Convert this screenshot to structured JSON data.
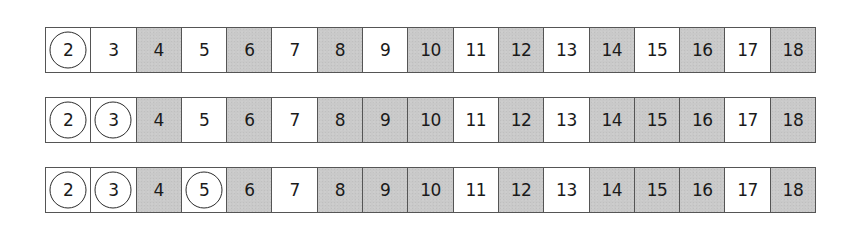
{
  "colors": {
    "shaded": "#c9c9c9",
    "unshaded": "#ffffff",
    "border": "#555555",
    "text": "#1a1a1a",
    "circle": "#2a2a2a"
  },
  "rows": [
    {
      "step": 1,
      "description": "2 circled; multiples of 2 shaded",
      "cells": [
        {
          "n": "2",
          "shaded": false,
          "circled": true
        },
        {
          "n": "3",
          "shaded": false,
          "circled": false
        },
        {
          "n": "4",
          "shaded": true,
          "circled": false
        },
        {
          "n": "5",
          "shaded": false,
          "circled": false
        },
        {
          "n": "6",
          "shaded": true,
          "circled": false
        },
        {
          "n": "7",
          "shaded": false,
          "circled": false
        },
        {
          "n": "8",
          "shaded": true,
          "circled": false
        },
        {
          "n": "9",
          "shaded": false,
          "circled": false
        },
        {
          "n": "10",
          "shaded": true,
          "circled": false
        },
        {
          "n": "11",
          "shaded": false,
          "circled": false
        },
        {
          "n": "12",
          "shaded": true,
          "circled": false
        },
        {
          "n": "13",
          "shaded": false,
          "circled": false
        },
        {
          "n": "14",
          "shaded": true,
          "circled": false
        },
        {
          "n": "15",
          "shaded": false,
          "circled": false
        },
        {
          "n": "16",
          "shaded": true,
          "circled": false
        },
        {
          "n": "17",
          "shaded": false,
          "circled": false
        },
        {
          "n": "18",
          "shaded": true,
          "circled": false
        }
      ]
    },
    {
      "step": 2,
      "description": "2 and 3 circled; multiples of 2 and 3 shaded",
      "cells": [
        {
          "n": "2",
          "shaded": false,
          "circled": true
        },
        {
          "n": "3",
          "shaded": false,
          "circled": true
        },
        {
          "n": "4",
          "shaded": true,
          "circled": false
        },
        {
          "n": "5",
          "shaded": false,
          "circled": false
        },
        {
          "n": "6",
          "shaded": true,
          "circled": false
        },
        {
          "n": "7",
          "shaded": false,
          "circled": false
        },
        {
          "n": "8",
          "shaded": true,
          "circled": false
        },
        {
          "n": "9",
          "shaded": true,
          "circled": false
        },
        {
          "n": "10",
          "shaded": true,
          "circled": false
        },
        {
          "n": "11",
          "shaded": false,
          "circled": false
        },
        {
          "n": "12",
          "shaded": true,
          "circled": false
        },
        {
          "n": "13",
          "shaded": false,
          "circled": false
        },
        {
          "n": "14",
          "shaded": true,
          "circled": false
        },
        {
          "n": "15",
          "shaded": true,
          "circled": false
        },
        {
          "n": "16",
          "shaded": true,
          "circled": false
        },
        {
          "n": "17",
          "shaded": false,
          "circled": false
        },
        {
          "n": "18",
          "shaded": true,
          "circled": false
        }
      ]
    },
    {
      "step": 3,
      "description": "2, 3 and 5 circled; composites shaded",
      "cells": [
        {
          "n": "2",
          "shaded": false,
          "circled": true
        },
        {
          "n": "3",
          "shaded": false,
          "circled": true
        },
        {
          "n": "4",
          "shaded": true,
          "circled": false
        },
        {
          "n": "5",
          "shaded": false,
          "circled": true
        },
        {
          "n": "6",
          "shaded": true,
          "circled": false
        },
        {
          "n": "7",
          "shaded": false,
          "circled": false
        },
        {
          "n": "8",
          "shaded": true,
          "circled": false
        },
        {
          "n": "9",
          "shaded": true,
          "circled": false
        },
        {
          "n": "10",
          "shaded": true,
          "circled": false
        },
        {
          "n": "11",
          "shaded": false,
          "circled": false
        },
        {
          "n": "12",
          "shaded": true,
          "circled": false
        },
        {
          "n": "13",
          "shaded": false,
          "circled": false
        },
        {
          "n": "14",
          "shaded": true,
          "circled": false
        },
        {
          "n": "15",
          "shaded": true,
          "circled": false
        },
        {
          "n": "16",
          "shaded": true,
          "circled": false
        },
        {
          "n": "17",
          "shaded": false,
          "circled": false
        },
        {
          "n": "18",
          "shaded": true,
          "circled": false
        }
      ]
    }
  ]
}
